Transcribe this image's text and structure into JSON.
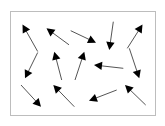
{
  "diagram": {
    "background": "#ffffff",
    "frame": {
      "x": 10.5,
      "y": 11.5,
      "width": 145,
      "height": 104,
      "stroke": "#bdbdbd"
    },
    "shaft_color": "#555555",
    "head_color": "#000000",
    "arrows": [
      {
        "id": 1,
        "tail": [
          37.7,
          51.5
        ],
        "head": [
          22.5,
          24.5
        ]
      },
      {
        "id": 2,
        "tail": [
          69.0,
          44.8
        ],
        "head": [
          46.5,
          28.3
        ]
      },
      {
        "id": 3,
        "tail": [
          70.7,
          30.7
        ],
        "head": [
          96.0,
          42.7
        ]
      },
      {
        "id": 4,
        "tail": [
          113.3,
          21.7
        ],
        "head": [
          109.3,
          50.0
        ]
      },
      {
        "id": 5,
        "tail": [
          127.3,
          48.3
        ],
        "head": [
          142.5,
          24.5
        ]
      },
      {
        "id": 6,
        "tail": [
          37.7,
          52.5
        ],
        "head": [
          25.0,
          78.3
        ]
      },
      {
        "id": 7,
        "tail": [
          61.7,
          80.0
        ],
        "head": [
          54.3,
          51.7
        ]
      },
      {
        "id": 8,
        "tail": [
          75.0,
          80.0
        ],
        "head": [
          84.3,
          51.7
        ]
      },
      {
        "id": 9,
        "tail": [
          123.3,
          68.3
        ],
        "head": [
          94.0,
          65.0
        ]
      },
      {
        "id": 10,
        "tail": [
          129.3,
          48.3
        ],
        "head": [
          139.3,
          78.3
        ]
      },
      {
        "id": 11,
        "tail": [
          21.0,
          85.0
        ],
        "head": [
          41.0,
          106.7
        ]
      },
      {
        "id": 12,
        "tail": [
          74.3,
          106.7
        ],
        "head": [
          53.3,
          85.0
        ]
      },
      {
        "id": 13,
        "tail": [
          116.7,
          90.0
        ],
        "head": [
          89.0,
          100.7
        ]
      },
      {
        "id": 14,
        "tail": [
          145.7,
          105.0
        ],
        "head": [
          125.0,
          85.0
        ]
      }
    ]
  }
}
